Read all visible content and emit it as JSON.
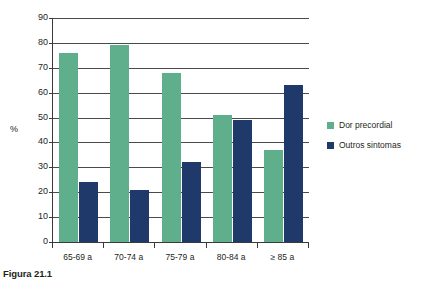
{
  "caption": "Figura 21.1",
  "chart_data": {
    "type": "bar",
    "title": "",
    "subtitle": "",
    "xlabel": "",
    "ylabel": "%",
    "ylim": [
      0,
      90
    ],
    "ytick_step": 10,
    "yticks": [
      90,
      80,
      70,
      60,
      50,
      40,
      30,
      20,
      10,
      0
    ],
    "grid": "horizontal",
    "legend_position": "right",
    "categories": [
      "65-69 a",
      "70-74 a",
      "75-79 a",
      "80-84 a",
      "≥ 85 a"
    ],
    "series": [
      {
        "name": "Dor precordial",
        "color": "#5FAF8C",
        "values": [
          76,
          79,
          68,
          51,
          37
        ]
      },
      {
        "name": "Outros sintomas",
        "color": "#20396B",
        "values": [
          24,
          21,
          32,
          49,
          63
        ]
      }
    ]
  },
  "colors": {
    "series_green": "#5FAF8C",
    "series_navy": "#20396B",
    "axis": "#3a3a3a",
    "gridline": "#4a4a4a",
    "text": "#231f20",
    "background": "#ffffff"
  }
}
